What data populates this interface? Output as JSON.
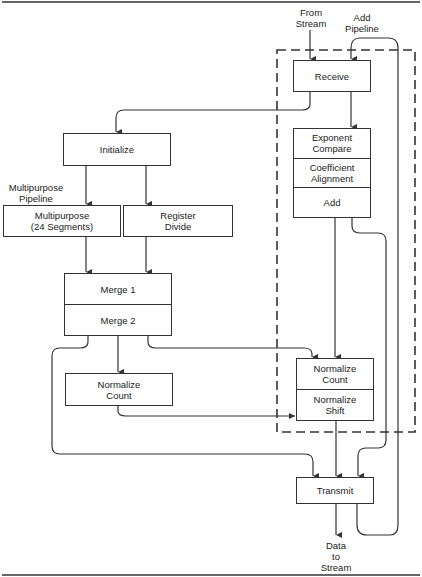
{
  "diagram": {
    "inputs": {
      "from_stream": "From\nStream",
      "add_pipeline": "Add\nPipeline",
      "multipurpose_pipeline": "Multipurpose\nPipeline",
      "data_to_stream": "Data\nto\nStream"
    },
    "blocks": {
      "receive": "Receive",
      "initialize": "Initialize",
      "multipurpose": "Multipurpose\n(24 Segments)",
      "register_divide": "Register\nDivide",
      "merge1": "Merge 1",
      "merge2": "Merge 2",
      "normalize_count_left": "Normalize\nCount",
      "exponent_compare": "Exponent\nCompare",
      "coefficient_alignment": "Coefficient\nAlignment",
      "add": "Add",
      "normalize_count_right": "Normalize\nCount",
      "normalize_shift": "Normalize\nShift",
      "transmit": "Transmit"
    },
    "colors": {
      "line": "#333333",
      "background": "#ffffff"
    }
  }
}
